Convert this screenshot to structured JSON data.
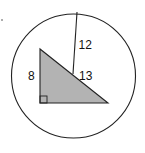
{
  "figure": {
    "type": "geometry-diagram",
    "labels": {
      "radius_segment": "12",
      "hypotenuse": "13",
      "vertical_leg": "8"
    },
    "colors": {
      "stroke": "#222222",
      "triangle_fill": "#b3b3b3",
      "background": "#ffffff"
    }
  }
}
